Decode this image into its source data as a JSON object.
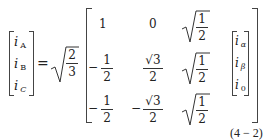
{
  "equation": {
    "number": "(4 − 2)",
    "lhs": {
      "entries": [
        {
          "base": "i",
          "sub": "A"
        },
        {
          "base": "i",
          "sub": "B"
        },
        {
          "base": "i",
          "sub": "C"
        }
      ]
    },
    "equals": "=",
    "scalar": {
      "type": "sqrt",
      "num": "2",
      "den": "3"
    },
    "matrix": {
      "rows": [
        [
          {
            "text": "1"
          },
          {
            "text": "0"
          },
          {
            "sqrt_num": "1",
            "sqrt_den": "2"
          }
        ],
        [
          {
            "sign": "−",
            "num": "1",
            "den": "2"
          },
          {
            "num": "√3",
            "den": "2"
          },
          {
            "sqrt_num": "1",
            "sqrt_den": "2"
          }
        ],
        [
          {
            "sign": "−",
            "num": "1",
            "den": "2"
          },
          {
            "sign": "−",
            "num": "√3",
            "den": "2"
          },
          {
            "sqrt_num": "1",
            "sqrt_den": "2"
          }
        ]
      ]
    },
    "rhs": {
      "entries": [
        {
          "base": "i",
          "sub": "α"
        },
        {
          "base": "i",
          "sub": "β"
        },
        {
          "base": "i",
          "sub": "0"
        }
      ]
    }
  }
}
